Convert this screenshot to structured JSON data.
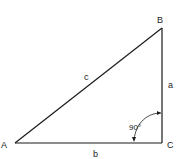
{
  "diagram": {
    "type": "right-triangle",
    "vertices": {
      "A": {
        "label": "A"
      },
      "B": {
        "label": "B"
      },
      "C": {
        "label": "C"
      }
    },
    "sides": {
      "a": {
        "label": "a"
      },
      "b": {
        "label": "b"
      },
      "c": {
        "label": "c"
      }
    },
    "right_angle": {
      "label": "90°",
      "at": "C"
    },
    "colors": {
      "line": "#1a1a1a",
      "background": "#ffffff"
    }
  }
}
